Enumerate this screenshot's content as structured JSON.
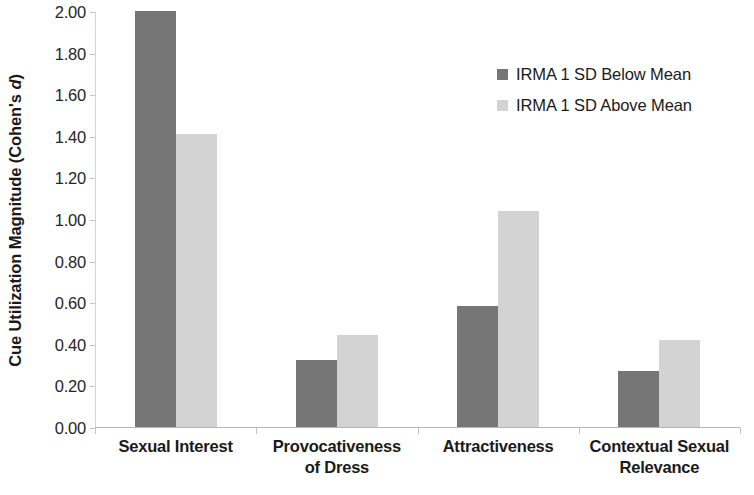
{
  "chart_data": {
    "type": "bar",
    "title": "",
    "xlabel": "",
    "ylabel": "Cue Utilization Magnitude (Cohen's d)",
    "ylabel_plain": "Cue Utilization Magnitude (Cohen's ",
    "ylabel_italic": "d",
    "ylabel_tail": ")",
    "categories": [
      "Sexual Interest",
      "Provocativeness of Dress",
      "Attractiveness",
      "Contextual Sexual Relevance"
    ],
    "category_lines": [
      [
        "Sexual Interest"
      ],
      [
        "Provocativeness",
        "of Dress"
      ],
      [
        "Attractiveness"
      ],
      [
        "Contextual Sexual",
        "Relevance"
      ]
    ],
    "series": [
      {
        "name": "IRMA 1 SD Below Mean",
        "color": "#767676",
        "values": [
          2.0,
          0.32,
          0.58,
          0.27
        ]
      },
      {
        "name": "IRMA 1 SD Above Mean",
        "color": "#d3d3d3",
        "values": [
          1.41,
          0.44,
          1.04,
          0.42
        ]
      }
    ],
    "ylim": [
      0.0,
      2.0
    ],
    "ytick_step": 0.2,
    "ytick_labels": [
      "2.00",
      "1.80",
      "1.60",
      "1.40",
      "1.20",
      "1.00",
      "0.80",
      "0.60",
      "0.40",
      "0.20",
      "0.00"
    ],
    "ytick_values": [
      2.0,
      1.8,
      1.6,
      1.4,
      1.2,
      1.0,
      0.8,
      0.6,
      0.4,
      0.2,
      0.0
    ],
    "grid": false,
    "legend_position": "top-right",
    "axis_color": "#c4c4c4",
    "text_color": "#1a1a1a"
  },
  "legend": {
    "items": [
      {
        "label": "IRMA 1 SD Below Mean",
        "color": "#767676"
      },
      {
        "label": "IRMA 1 SD Above Mean",
        "color": "#d3d3d3"
      }
    ]
  }
}
